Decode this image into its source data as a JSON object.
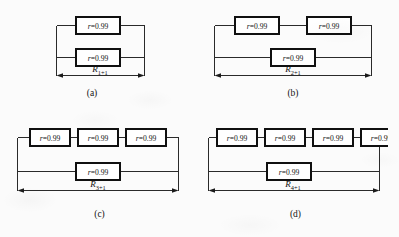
{
  "figure": {
    "background_color": "#fbfbfb",
    "line_color": "#2a2a2a",
    "box_border_color": "#101010",
    "box_fill_color": "#ffffff",
    "component_label": "r=0.99",
    "component_label_var": "r",
    "component_label_value": "=0.99",
    "reliability_value": 0.99
  },
  "panels": [
    {
      "id": "a",
      "letter": "(a)",
      "dimension_var": "R",
      "dimension_subscript": "1+1",
      "dimension_label": "R1+1",
      "top_branch_count": 1,
      "bottom_branch_count": 1,
      "components": [
        "r=0.99",
        "r=0.99"
      ]
    },
    {
      "id": "b",
      "letter": "(b)",
      "dimension_var": "R",
      "dimension_subscript": "2+1",
      "dimension_label": "R2+1",
      "top_branch_count": 2,
      "bottom_branch_count": 1,
      "components": [
        "r=0.99",
        "r=0.99",
        "r=0.99"
      ]
    },
    {
      "id": "c",
      "letter": "(c)",
      "dimension_var": "R",
      "dimension_subscript": "3+1",
      "dimension_label": "R3+1",
      "top_branch_count": 3,
      "bottom_branch_count": 1,
      "components": [
        "r=0.99",
        "r=0.99",
        "r=0.99",
        "r=0.99"
      ]
    },
    {
      "id": "d",
      "letter": "(d)",
      "dimension_var": "R",
      "dimension_subscript": "4+1",
      "dimension_label": "R4+1",
      "top_branch_count": 4,
      "bottom_branch_count": 1,
      "components": [
        "r=0.99",
        "r=0.99",
        "r=0.99",
        "r=0.99",
        "r=0.99"
      ]
    }
  ]
}
